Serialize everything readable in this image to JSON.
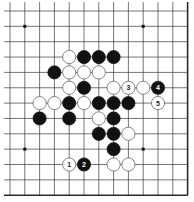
{
  "board": {
    "description": "Go problem diagram - bottom-right portion of a 19x19 board",
    "visible_columns": 13,
    "visible_rows": 13,
    "edges": [
      "right",
      "bottom"
    ],
    "colors": {
      "line": "#3a3a3a",
      "edge": "#2a2a2a",
      "black_stone": "#111111",
      "white_stone": "#ffffff",
      "white_stroke": "#555555",
      "background": "#ffffff"
    },
    "star_points": [
      {
        "col": 1,
        "row": 1
      },
      {
        "col": 9,
        "row": 1
      },
      {
        "col": 1,
        "row": 9
      },
      {
        "col": 9,
        "row": 9
      }
    ],
    "stones": [
      {
        "color": "white",
        "col": 4,
        "row": 3,
        "label": ""
      },
      {
        "color": "black",
        "col": 5,
        "row": 3,
        "label": ""
      },
      {
        "color": "black",
        "col": 6,
        "row": 3,
        "label": ""
      },
      {
        "color": "black",
        "col": 7,
        "row": 3,
        "label": ""
      },
      {
        "color": "black",
        "col": 3,
        "row": 4,
        "label": ""
      },
      {
        "color": "white",
        "col": 4,
        "row": 4,
        "label": ""
      },
      {
        "color": "white",
        "col": 5,
        "row": 4,
        "label": ""
      },
      {
        "color": "white",
        "col": 6,
        "row": 4,
        "label": ""
      },
      {
        "color": "white",
        "col": 4,
        "row": 5,
        "label": ""
      },
      {
        "color": "black",
        "col": 5,
        "row": 5,
        "label": ""
      },
      {
        "color": "white",
        "col": 7,
        "row": 5,
        "label": ""
      },
      {
        "color": "white",
        "col": 8,
        "row": 5,
        "label": "3"
      },
      {
        "color": "white",
        "col": 9,
        "row": 5,
        "label": ""
      },
      {
        "color": "black",
        "col": 10,
        "row": 5,
        "label": "4"
      },
      {
        "color": "white",
        "col": 2,
        "row": 6,
        "label": ""
      },
      {
        "color": "white",
        "col": 3,
        "row": 6,
        "label": ""
      },
      {
        "color": "black",
        "col": 4,
        "row": 6,
        "label": ""
      },
      {
        "color": "white",
        "col": 5,
        "row": 6,
        "label": ""
      },
      {
        "color": "black",
        "col": 6,
        "row": 6,
        "label": ""
      },
      {
        "color": "black",
        "col": 7,
        "row": 6,
        "label": ""
      },
      {
        "color": "black",
        "col": 8,
        "row": 6,
        "label": ""
      },
      {
        "color": "white",
        "col": 10,
        "row": 6,
        "label": "5"
      },
      {
        "color": "black",
        "col": 2,
        "row": 7,
        "label": ""
      },
      {
        "color": "black",
        "col": 4,
        "row": 7,
        "label": ""
      },
      {
        "color": "white",
        "col": 6,
        "row": 7,
        "label": ""
      },
      {
        "color": "black",
        "col": 7,
        "row": 7,
        "label": ""
      },
      {
        "color": "black",
        "col": 6,
        "row": 8,
        "label": ""
      },
      {
        "color": "black",
        "col": 7,
        "row": 8,
        "label": ""
      },
      {
        "color": "white",
        "col": 8,
        "row": 8,
        "label": ""
      },
      {
        "color": "black",
        "col": 7,
        "row": 9,
        "label": ""
      },
      {
        "color": "white",
        "col": 4,
        "row": 10,
        "label": "1"
      },
      {
        "color": "black",
        "col": 5,
        "row": 10,
        "label": "2"
      },
      {
        "color": "white",
        "col": 7,
        "row": 10,
        "label": ""
      },
      {
        "color": "white",
        "col": 8,
        "row": 10,
        "label": ""
      }
    ]
  }
}
